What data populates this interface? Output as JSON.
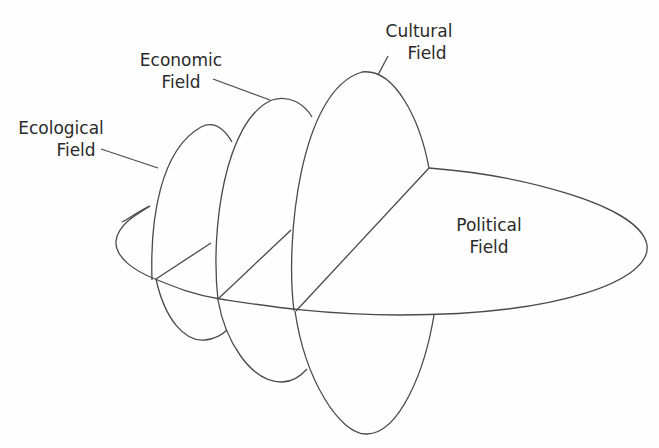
{
  "diagram": {
    "type": "nested-fields",
    "stroke_color": "#4a4a4a",
    "background": "#fefefe",
    "fields": [
      {
        "id": "ecological",
        "line1": "Ecological",
        "line2": "Field"
      },
      {
        "id": "economic",
        "line1": "Economic",
        "line2": "Field"
      },
      {
        "id": "cultural",
        "line1": "Cultural",
        "line2": "Field"
      },
      {
        "id": "political",
        "line1": "Political",
        "line2": "Field"
      }
    ]
  }
}
